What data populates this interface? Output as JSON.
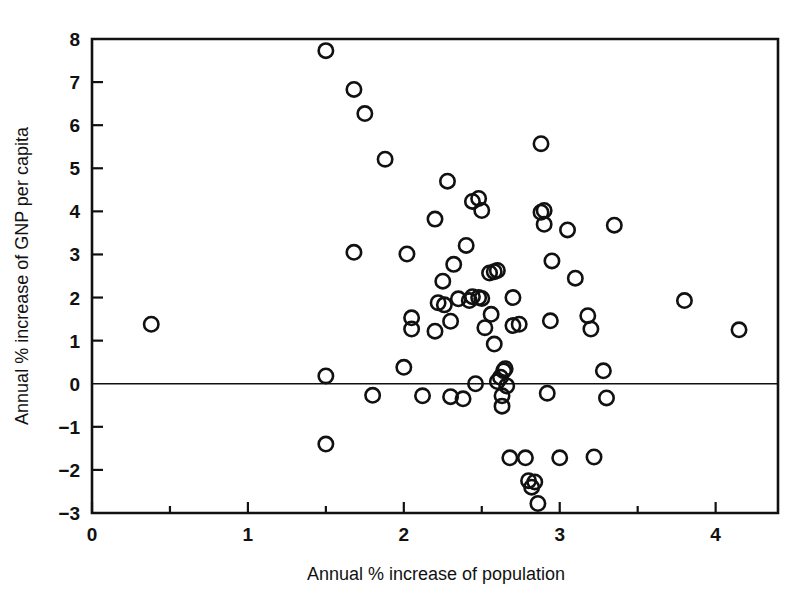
{
  "chart_data": {
    "type": "scatter",
    "title": "",
    "xlabel": "Annual % increase of population",
    "ylabel": "Annual % increase of GNP per capita",
    "xlim": [
      0,
      4.4
    ],
    "ylim": [
      -3,
      8
    ],
    "grid": false,
    "legend": null,
    "marker": "open-circle",
    "marker_color": "#111111",
    "xticks": [
      0,
      1,
      2,
      3,
      4
    ],
    "xtick_labels": [
      "0",
      "1",
      "2",
      "3",
      "4"
    ],
    "xminor_ticks": [
      0.5,
      1.5,
      2.5,
      3.5
    ],
    "yticks": [
      -3,
      -2,
      -1,
      0,
      1,
      2,
      3,
      4,
      5,
      6,
      7,
      8
    ],
    "ytick_labels": [
      "−3",
      "−2",
      "−1",
      "0",
      "1",
      "2",
      "3",
      "4",
      "5",
      "6",
      "7",
      "8"
    ],
    "zero_line": 0,
    "n_points": 74,
    "points": [
      [
        0.38,
        1.38
      ],
      [
        1.5,
        7.73
      ],
      [
        1.5,
        0.18
      ],
      [
        1.5,
        -1.4
      ],
      [
        1.68,
        6.83
      ],
      [
        1.68,
        3.05
      ],
      [
        1.75,
        6.27
      ],
      [
        1.8,
        -0.27
      ],
      [
        1.88,
        5.21
      ],
      [
        2.0,
        0.38
      ],
      [
        2.02,
        3.01
      ],
      [
        2.05,
        1.27
      ],
      [
        2.05,
        1.53
      ],
      [
        2.12,
        -0.28
      ],
      [
        2.2,
        3.82
      ],
      [
        2.22,
        1.88
      ],
      [
        2.25,
        2.38
      ],
      [
        2.28,
        4.7
      ],
      [
        2.32,
        2.77
      ],
      [
        2.35,
        1.97
      ],
      [
        2.38,
        -0.35
      ],
      [
        2.4,
        3.21
      ],
      [
        2.42,
        1.93
      ],
      [
        2.44,
        4.23
      ],
      [
        2.48,
        4.3
      ],
      [
        2.5,
        4.02
      ],
      [
        2.5,
        1.98
      ],
      [
        2.52,
        1.3
      ],
      [
        2.55,
        2.57
      ],
      [
        2.56,
        1.61
      ],
      [
        2.58,
        0.92
      ],
      [
        2.6,
        2.63
      ],
      [
        2.62,
        0.15
      ],
      [
        2.63,
        -0.28
      ],
      [
        2.63,
        -0.52
      ],
      [
        2.64,
        0.3
      ],
      [
        2.66,
        -0.05
      ],
      [
        2.68,
        -1.72
      ],
      [
        2.7,
        2.0
      ],
      [
        2.74,
        1.38
      ],
      [
        2.78,
        -1.72
      ],
      [
        2.8,
        -2.25
      ],
      [
        2.82,
        -2.4
      ],
      [
        2.84,
        -2.28
      ],
      [
        2.86,
        -2.78
      ],
      [
        2.88,
        5.57
      ],
      [
        2.9,
        4.02
      ],
      [
        2.9,
        3.7
      ],
      [
        2.92,
        -0.22
      ],
      [
        2.94,
        1.46
      ],
      [
        2.95,
        2.85
      ],
      [
        3.0,
        -1.72
      ],
      [
        3.05,
        3.57
      ],
      [
        3.1,
        2.45
      ],
      [
        3.18,
        1.58
      ],
      [
        3.2,
        1.27
      ],
      [
        3.22,
        -1.7
      ],
      [
        3.28,
        0.3
      ],
      [
        3.3,
        -0.33
      ],
      [
        3.35,
        3.68
      ],
      [
        3.8,
        1.93
      ],
      [
        4.15,
        1.25
      ],
      [
        2.26,
        1.83
      ],
      [
        2.44,
        2.02
      ],
      [
        2.3,
        1.45
      ],
      [
        2.7,
        1.35
      ],
      [
        2.46,
        0.0
      ],
      [
        2.6,
        0.05
      ],
      [
        2.3,
        -0.3
      ],
      [
        2.65,
        0.35
      ],
      [
        2.2,
        1.22
      ],
      [
        2.48,
        2.0
      ],
      [
        2.58,
        2.6
      ],
      [
        2.88,
        3.98
      ]
    ]
  },
  "figure": {
    "background": "#ffffff",
    "axis_color": "#111111"
  }
}
